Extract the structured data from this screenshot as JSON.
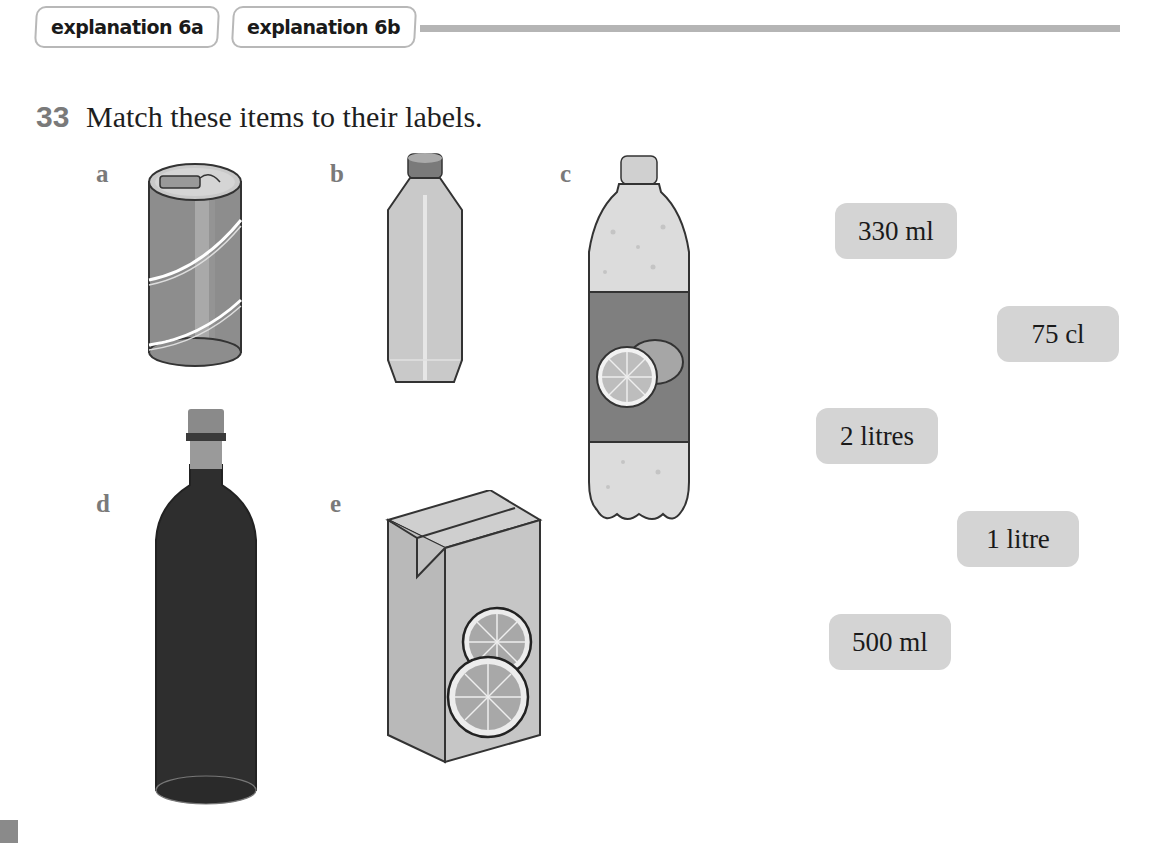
{
  "header": {
    "tabs": [
      {
        "label": "explanation 6a"
      },
      {
        "label": "explanation 6b"
      }
    ]
  },
  "question": {
    "number": "33",
    "instruction": "Match these items to their labels."
  },
  "items": [
    {
      "letter": "a",
      "description": "drink can",
      "icon": "soda-can-icon"
    },
    {
      "letter": "b",
      "description": "small plastic water bottle",
      "icon": "water-bottle-icon"
    },
    {
      "letter": "c",
      "description": "large lemonade bottle",
      "icon": "lemonade-bottle-icon"
    },
    {
      "letter": "d",
      "description": "wine bottle",
      "icon": "wine-bottle-icon"
    },
    {
      "letter": "e",
      "description": "juice carton",
      "icon": "juice-carton-icon"
    }
  ],
  "labels": [
    {
      "text": "330 ml"
    },
    {
      "text": "75 cl"
    },
    {
      "text": "2 litres"
    },
    {
      "text": "1 litre"
    },
    {
      "text": "500 ml"
    }
  ],
  "colors": {
    "label_bg": "#d4d4d4",
    "tab_border": "#b8b8b8",
    "rule": "#b5b5b5",
    "question_number": "#7a7a7a"
  }
}
